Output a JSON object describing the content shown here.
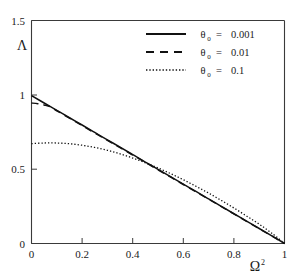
{
  "chart_data": {
    "type": "line",
    "title": "",
    "xlabel": "Ω",
    "xlabel_sup": "2",
    "ylabel": "Λ",
    "xlim": [
      0,
      1
    ],
    "ylim": [
      0,
      1.5
    ],
    "grid": false,
    "legend_position": "top-right",
    "xticks": [
      "0",
      "0.2",
      "0.4",
      "0.6",
      "0.8",
      "1"
    ],
    "xtick_values": [
      0,
      0.2,
      0.4,
      0.6,
      0.8,
      1
    ],
    "yticks": [
      "0",
      "0.5",
      "1",
      "1.5"
    ],
    "ytick_values": [
      0,
      0.5,
      1,
      1.5
    ],
    "series": [
      {
        "name": "theta0-0.001",
        "legend_symbol": "θ",
        "legend_sub": "0",
        "legend_eq": "=",
        "legend_value": "0.001",
        "style": "solid",
        "x": [
          0,
          0.05,
          0.1,
          0.15,
          0.2,
          0.25,
          0.3,
          0.35,
          0.4,
          0.45,
          0.5,
          0.55,
          0.6,
          0.65,
          0.7,
          0.75,
          0.8,
          0.85,
          0.9,
          0.95,
          1
        ],
        "y": [
          0.995,
          0.945,
          0.896,
          0.846,
          0.797,
          0.747,
          0.697,
          0.648,
          0.598,
          0.548,
          0.499,
          0.449,
          0.399,
          0.35,
          0.3,
          0.25,
          0.2,
          0.151,
          0.101,
          0.051,
          0.0
        ]
      },
      {
        "name": "theta0-0.01",
        "legend_symbol": "θ",
        "legend_sub": "0",
        "legend_eq": "=",
        "legend_value": "0.01",
        "style": "dashed",
        "x": [
          0,
          0.025,
          0.05,
          0.075,
          0.1,
          0.15,
          0.2,
          0.3,
          0.4,
          0.5,
          0.6,
          0.7,
          0.8,
          0.9,
          1
        ],
        "y": [
          0.945,
          0.94,
          0.932,
          0.92,
          0.893,
          0.843,
          0.793,
          0.694,
          0.595,
          0.496,
          0.397,
          0.298,
          0.199,
          0.1,
          0.0
        ]
      },
      {
        "name": "theta0-0.1",
        "legend_symbol": "θ",
        "legend_sub": "0",
        "legend_eq": "=",
        "legend_value": "0.1",
        "style": "dotted",
        "x": [
          0,
          0.05,
          0.1,
          0.15,
          0.2,
          0.25,
          0.3,
          0.35,
          0.4,
          0.45,
          0.5,
          0.55,
          0.6,
          0.65,
          0.7,
          0.75,
          0.8,
          0.85,
          0.9,
          0.95,
          1
        ],
        "y": [
          0.672,
          0.676,
          0.676,
          0.671,
          0.661,
          0.646,
          0.627,
          0.603,
          0.575,
          0.543,
          0.508,
          0.47,
          0.429,
          0.385,
          0.339,
          0.29,
          0.239,
          0.185,
          0.13,
          0.069,
          0.0
        ]
      }
    ]
  },
  "legend": {
    "entries": [
      {
        "symbol": "θ",
        "sub": "0",
        "eq": "=",
        "value": "0.001",
        "style": "solid"
      },
      {
        "symbol": "θ",
        "sub": "0",
        "eq": "=",
        "value": "0.01",
        "style": "dashed"
      },
      {
        "symbol": "θ",
        "sub": "0",
        "eq": "=",
        "value": "0.1",
        "style": "dotted"
      }
    ]
  },
  "axes": {
    "y_label": "Λ",
    "x_label": "Ω",
    "x_label_sup": "2",
    "x_ticklabels": [
      "0",
      "0.2",
      "0.4",
      "0.6",
      "0.8",
      "1"
    ],
    "y_ticklabels": [
      "0",
      "0.5",
      "1",
      "1.5"
    ]
  },
  "colors": {
    "background": "#ffffff",
    "axis": "#3a3a3a",
    "curve": "#111111",
    "text": "#1a1a1a"
  }
}
